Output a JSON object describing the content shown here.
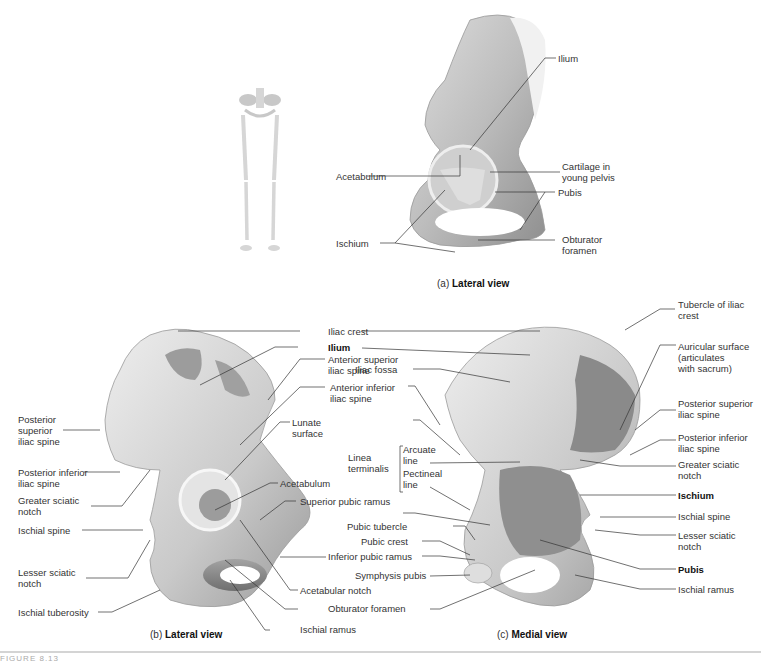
{
  "figure": {
    "panel_a": {
      "caption_prefix": "(a)",
      "caption_title": "Lateral view",
      "labels": {
        "ilium": "Ilium",
        "acetabulum": "Acetabulum",
        "cartilage_1": "Cartilage in",
        "cartilage_2": "young pelvis",
        "pubis": "Pubis",
        "ischium": "Ischium",
        "obturator_1": "Obturator",
        "obturator_2": "foramen"
      }
    },
    "panel_b": {
      "caption_prefix": "(b)",
      "caption_title": "Lateral view",
      "labels": {
        "iliac_crest": "Iliac crest",
        "ilium": "Ilium",
        "asis_1": "Anterior superior",
        "asis_2": "iliac spine",
        "aiis_1": "Anterior inferior",
        "aiis_2": "iliac spine",
        "lunate_1": "Lunate",
        "lunate_2": "surface",
        "acetabulum": "Acetabulum",
        "superior_pubic_ramus": "Superior pubic ramus",
        "inferior_pubic_ramus": "Inferior pubic ramus",
        "acetabular_notch": "Acetabular notch",
        "obturator_foramen": "Obturator foramen",
        "ischial_ramus": "Ischial ramus",
        "psis_1": "Posterior",
        "psis_2": "superior",
        "psis_3": "iliac spine",
        "piis_1": "Posterior inferior",
        "piis_2": "iliac spine",
        "gsn_1": "Greater sciatic",
        "gsn_2": "notch",
        "ischial_spine": "Ischial spine",
        "lsn_1": "Lesser sciatic",
        "lsn_2": "notch",
        "ischial_tuberosity": "Ischial tuberosity"
      }
    },
    "panel_c": {
      "caption_prefix": "(c)",
      "caption_title": "Medial view",
      "labels": {
        "iliac_fossa": "Iliac fossa",
        "linea_1": "Linea",
        "linea_2": "terminalis",
        "arcuate_1": "Arcuate",
        "arcuate_2": "line",
        "pectineal_1": "Pectineal",
        "pectineal_2": "line",
        "pubic_tubercle": "Pubic tubercle",
        "pubic_crest": "Pubic crest",
        "symphysis_pubis": "Symphysis pubis",
        "tubercle_1": "Tubercle of iliac",
        "tubercle_2": "crest",
        "auricular_1": "Auricular surface",
        "auricular_2": "(articulates",
        "auricular_3": "with sacrum)",
        "psis_1": "Posterior superior",
        "psis_2": "iliac spine",
        "piis_1": "Posterior inferior",
        "piis_2": "iliac spine",
        "gsn_1": "Greater sciatic",
        "gsn_2": "notch",
        "ischium": "Ischium",
        "ischial_spine": "Ischial spine",
        "lsn_1": "Lesser sciatic",
        "lsn_2": "notch",
        "pubis": "Pubis",
        "ischial_ramus": "Ischial ramus"
      }
    },
    "footer": {
      "figure_label": "FIGURE 8.13"
    },
    "colors": {
      "bone_light": "#e6e6e6",
      "bone_mid": "#b8b8b8",
      "bone_dark": "#7c7c7c",
      "leader": "#333333"
    }
  }
}
